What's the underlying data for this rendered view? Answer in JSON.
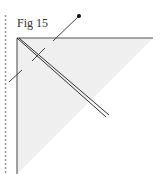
{
  "figure": {
    "label": "Fig 15",
    "colors": {
      "paper_fill": "#efefef",
      "line": "#444444",
      "dotted_guide": "#999999",
      "dot": "#111111"
    }
  }
}
